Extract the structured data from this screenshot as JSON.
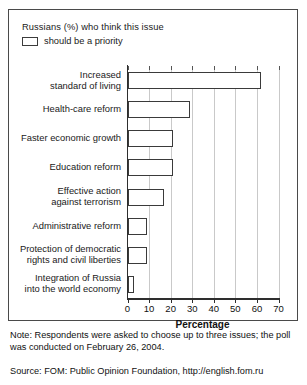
{
  "legend": {
    "title": "Russians (%) who think this issue",
    "series_label": "should be a priority",
    "swatch_name": "legend-swatch-priority"
  },
  "footer": {
    "note": "Note: Respondents were asked to choose up to three issues; the poll was conducted on February 26, 2004.",
    "source": "Source: FOM: Public Opinion Foundation, http://english.fom.ru"
  },
  "colors": {
    "bar_fill": "#ffffff",
    "bar_edge": "#3a3a3a",
    "axis": "#2e2e2e",
    "grid": "#c9c9c9",
    "frame": "#4a4a4a",
    "text": "#1a1a1a"
  },
  "chart_data": {
    "type": "bar",
    "orientation": "horizontal",
    "title": "",
    "subtitle": "",
    "xlabel": "Percentage",
    "ylabel": "",
    "xlim": [
      0,
      70
    ],
    "xticks": [
      0,
      10,
      20,
      30,
      40,
      50,
      60,
      70
    ],
    "xtick_labels": [
      "0",
      "10",
      "20",
      "30",
      "40",
      "50",
      "60",
      "70"
    ],
    "grid": true,
    "grid_axis": "x",
    "legend_position": "above-plot-left",
    "series": [
      {
        "name": "should be a priority",
        "values": [
          62,
          29,
          21,
          21,
          17,
          9,
          9,
          3
        ]
      }
    ],
    "categories": [
      "Increased\nstandard of living",
      "Health-care reform",
      "Faster economic growth",
      "Education reform",
      "Effective action\nagainst terrorism",
      "Administrative reform",
      "Protection of democratic\nrights and civil liberties",
      "Integration of Russia\ninto the world economy"
    ]
  }
}
